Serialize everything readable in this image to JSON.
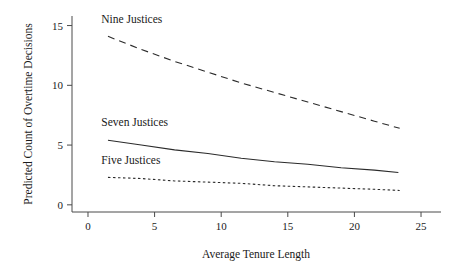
{
  "chart_data": {
    "type": "line",
    "title": "",
    "subtitle": "",
    "xlabel": "Average Tenure Length",
    "ylabel": "Predicted Count of Overtime Decisions",
    "xlim": [
      -1.2,
      26.5
    ],
    "ylim": [
      -0.6,
      15.8
    ],
    "xticks": [
      0,
      5,
      10,
      15,
      20,
      25
    ],
    "xtick_labels": [
      "0",
      "5",
      "10",
      "15",
      "20",
      "25"
    ],
    "yticks": [
      0,
      5,
      10,
      15
    ],
    "ytick_labels": [
      "0",
      "5",
      "10",
      "15"
    ],
    "grid": false,
    "legend_position": "inline-annotations",
    "series": [
      {
        "name": "Nine Justices",
        "style": "dashed",
        "label": "Nine Justices",
        "x": [
          1.5,
          4.0,
          6.5,
          9.0,
          11.5,
          14.0,
          16.5,
          19.0,
          21.5,
          23.4
        ],
        "values": [
          14.1,
          13.0,
          12.0,
          11.1,
          10.2,
          9.4,
          8.6,
          7.8,
          7.0,
          6.4
        ]
      },
      {
        "name": "Seven Justices",
        "style": "solid",
        "label": "Seven Justices",
        "x": [
          1.5,
          4.0,
          6.5,
          9.0,
          11.5,
          14.0,
          16.5,
          19.0,
          21.5,
          23.3
        ],
        "values": [
          5.4,
          5.0,
          4.6,
          4.3,
          3.9,
          3.6,
          3.4,
          3.1,
          2.9,
          2.7
        ]
      },
      {
        "name": "Five Justices",
        "style": "dotted",
        "label": "Five Justices",
        "x": [
          1.5,
          4.0,
          6.5,
          9.0,
          11.5,
          14.0,
          16.5,
          19.0,
          21.5,
          23.4
        ],
        "values": [
          2.3,
          2.2,
          2.0,
          1.9,
          1.8,
          1.6,
          1.5,
          1.4,
          1.3,
          1.2
        ]
      }
    ],
    "annotations": [
      {
        "text": "Nine Justices",
        "x": 1.0,
        "y": 15.2
      },
      {
        "text": "Seven Justices",
        "x": 1.0,
        "y": 6.6
      },
      {
        "text": "Five Justices",
        "x": 1.0,
        "y": 3.4
      }
    ]
  }
}
